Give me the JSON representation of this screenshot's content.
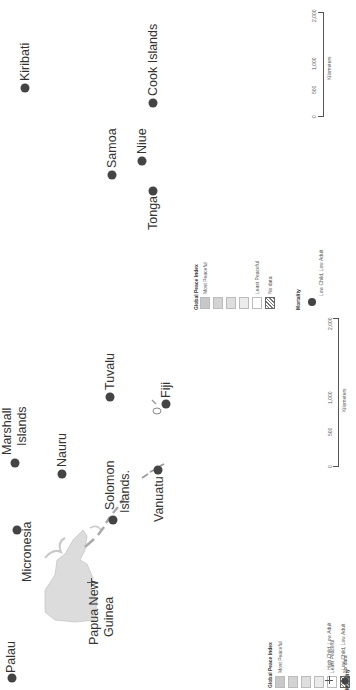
{
  "map": {
    "countries": [
      {
        "name": "Palau",
        "x": 12,
        "y": 678,
        "lx": 6,
        "ly": 672
      },
      {
        "name": "Micronesia",
        "x": 17,
        "y": 530,
        "lx": 17,
        "ly": 582
      },
      {
        "name": "Marshall Islands",
        "line1": "Marshall",
        "line2": "Islands",
        "x": 15,
        "y": 463
      },
      {
        "name": "Nauru",
        "x": 62,
        "y": 474
      },
      {
        "name": "Papua New Guinea",
        "line1": "Papua New",
        "line2": "Guinea",
        "x": 93,
        "y": 583
      },
      {
        "name": "Solomon Islands.",
        "line1": "Solomon",
        "line2": "Islands.",
        "x": 113,
        "y": 520
      },
      {
        "name": "Tuvalu",
        "x": 110,
        "y": 397
      },
      {
        "name": "Vanuatu",
        "x": 158,
        "y": 470
      },
      {
        "name": "Fiji",
        "x": 166,
        "y": 404
      },
      {
        "name": "Kiribati",
        "x": 25,
        "y": 88
      },
      {
        "name": "Samoa",
        "x": 112,
        "y": 175
      },
      {
        "name": "Niue",
        "x": 142,
        "y": 161
      },
      {
        "name": "Tonga",
        "x": 153,
        "y": 191
      },
      {
        "name": "Cook Islands",
        "x": 153,
        "y": 103
      }
    ]
  },
  "legend_left": {
    "peace_title": "Global Peace Index",
    "most_peaceful": "Most Peaceful",
    "least_peaceful": "Least Peaceful",
    "no_data": "No data",
    "mortality_title": "Mortality",
    "mortality_items": [
      "High Child, Low Adult",
      "Low Child, Low Adult"
    ]
  },
  "legend_right": {
    "peace_title": "Global Peace Index",
    "most_peaceful": "Most Peaceful",
    "least_peaceful": "Least Peaceful",
    "no_data": "No data",
    "mortality_title": "Mortality",
    "mortality_items": [
      "Low Child, Low Adult"
    ]
  },
  "scale_bar": {
    "unit": "Kilometers",
    "ticks": [
      "0",
      "500",
      "1,000",
      "2,000"
    ]
  },
  "colors": {
    "dot": "#444444",
    "land": "#dcdcdc",
    "swatches": [
      "#c8c8c8",
      "#d3d3d3",
      "#dedede",
      "#ebebeb",
      "#ffffff"
    ]
  }
}
